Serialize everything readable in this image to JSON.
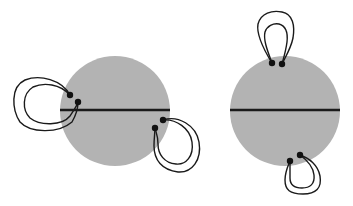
{
  "diagram": {
    "colors": {
      "disk_fill": "#b3b3b3",
      "line": "#1a1a1a",
      "background": "#ffffff"
    },
    "disks": [
      {
        "id": "left",
        "cx": 115,
        "cy": 111,
        "r": 55,
        "chord": {
          "x1": 60,
          "y1": 110,
          "x2": 170,
          "y2": 110
        },
        "attachments": [
          {
            "side": "upper-left",
            "points": [
              [
                70,
                95
              ],
              [
                78,
                102
              ]
            ]
          },
          {
            "side": "lower-right",
            "points": [
              [
                163,
                120
              ],
              [
                155,
                128
              ]
            ]
          }
        ]
      },
      {
        "id": "right",
        "cx": 285,
        "cy": 111,
        "r": 55,
        "chord": {
          "x1": 230,
          "y1": 110,
          "x2": 340,
          "y2": 110
        },
        "attachments": [
          {
            "side": "top",
            "points": [
              [
                272,
                63
              ],
              [
                282,
                64
              ]
            ]
          },
          {
            "side": "bottom",
            "points": [
              [
                300,
                155
              ],
              [
                290,
                161
              ]
            ]
          }
        ]
      }
    ]
  }
}
